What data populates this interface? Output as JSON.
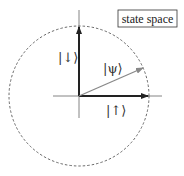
{
  "diagram": {
    "title_box": "state space",
    "labels": {
      "down": "|↓⟩",
      "up": "|↑⟩",
      "psi": "|ψ⟩"
    },
    "colors": {
      "basis_arrows": "#222222",
      "psi_arrow": "#888888",
      "circle": "#444444",
      "axes": "#555555"
    },
    "geometry": {
      "center": [
        79,
        96
      ],
      "radius": 70
    }
  }
}
